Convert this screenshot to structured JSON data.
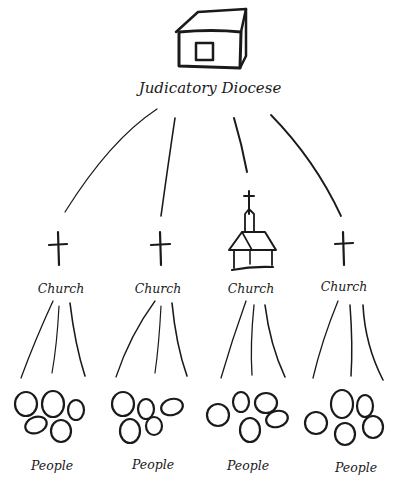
{
  "diagram": {
    "root": {
      "label": "Judicatory Diocese",
      "icon": "building-icon"
    },
    "churches": [
      {
        "label": "Church",
        "icon": "cross-icon",
        "people_label": "People"
      },
      {
        "label": "Church",
        "icon": "cross-icon",
        "people_label": "People"
      },
      {
        "label": "Church",
        "icon": "church-building-icon",
        "people_label": "People"
      },
      {
        "label": "Church",
        "icon": "cross-icon",
        "people_label": "People"
      }
    ],
    "colors": {
      "ink": "#1a1a1a",
      "background": "#ffffff"
    }
  }
}
